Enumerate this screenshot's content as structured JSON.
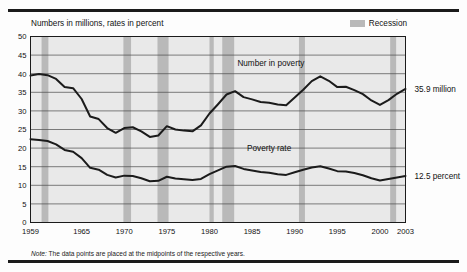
{
  "figure": {
    "subtitle": "Numbers in millions, rates in percent",
    "note_prefix": "Note:",
    "note_text": " The data points are placed at the midpoints of the respective years.",
    "legend_label": "Recession",
    "recession_color": "#b9b9b9",
    "line_color": "#1b1b1b",
    "grid_color": "#4a4a4a",
    "plot_bg": "#e9e9e9",
    "frame_color": "#1b1b1b"
  },
  "chart_data": {
    "type": "line",
    "title": "",
    "subtitle": "Numbers in millions, rates in percent",
    "xlabel": "",
    "ylabel": "",
    "ylim": [
      0,
      50
    ],
    "xlim": [
      1959,
      2003
    ],
    "ytick_step": 5,
    "yticks": [
      0,
      5,
      10,
      15,
      20,
      25,
      30,
      35,
      40,
      45,
      50
    ],
    "xticks": [
      1959,
      1965,
      1970,
      1975,
      1980,
      1985,
      1990,
      1995,
      2000,
      2003
    ],
    "grid": true,
    "legend_position": "top-right",
    "x": [
      1959,
      1960,
      1961,
      1962,
      1963,
      1964,
      1965,
      1966,
      1967,
      1968,
      1969,
      1970,
      1971,
      1972,
      1973,
      1974,
      1975,
      1976,
      1977,
      1978,
      1979,
      1980,
      1981,
      1982,
      1983,
      1984,
      1985,
      1986,
      1987,
      1988,
      1989,
      1990,
      1991,
      1992,
      1993,
      1994,
      1995,
      1996,
      1997,
      1998,
      1999,
      2000,
      2001,
      2002,
      2003
    ],
    "series": [
      {
        "name": "Number in poverty",
        "label": "Number in poverty",
        "units": "millions",
        "end_label": "35.9 million",
        "values": [
          39.5,
          39.9,
          39.6,
          38.6,
          36.4,
          36.1,
          33.2,
          28.5,
          27.8,
          25.4,
          24.1,
          25.4,
          25.6,
          24.5,
          23.0,
          23.4,
          25.9,
          25.0,
          24.7,
          24.5,
          26.1,
          29.3,
          31.8,
          34.4,
          35.3,
          33.7,
          33.1,
          32.4,
          32.2,
          31.7,
          31.5,
          33.6,
          35.7,
          38.0,
          39.3,
          38.1,
          36.4,
          36.5,
          35.6,
          34.5,
          32.8,
          31.6,
          32.9,
          34.6,
          35.9
        ]
      },
      {
        "name": "Poverty rate",
        "label": "Poverty rate",
        "units": "percent",
        "end_label": "12.5 percent",
        "values": [
          22.4,
          22.2,
          21.9,
          21.0,
          19.5,
          19.0,
          17.3,
          14.7,
          14.2,
          12.8,
          12.1,
          12.6,
          12.5,
          11.9,
          11.1,
          11.2,
          12.3,
          11.8,
          11.6,
          11.4,
          11.7,
          13.0,
          14.0,
          15.0,
          15.2,
          14.4,
          14.0,
          13.6,
          13.4,
          13.0,
          12.8,
          13.5,
          14.2,
          14.8,
          15.1,
          14.5,
          13.8,
          13.7,
          13.3,
          12.7,
          11.9,
          11.3,
          11.7,
          12.1,
          12.5
        ]
      }
    ],
    "recessions": [
      {
        "start": 1960.3,
        "end": 1961.1
      },
      {
        "start": 1969.9,
        "end": 1970.8
      },
      {
        "start": 1973.9,
        "end": 1975.2
      },
      {
        "start": 1980.0,
        "end": 1980.5
      },
      {
        "start": 1981.5,
        "end": 1982.9
      },
      {
        "start": 1990.5,
        "end": 1991.2
      },
      {
        "start": 2001.2,
        "end": 2001.9
      }
    ],
    "annotations": [
      {
        "text": "Number in poverty",
        "x": 1987.2,
        "y": 42.0
      },
      {
        "text": "Poverty rate",
        "x": 1987.0,
        "y": 19.2
      }
    ]
  }
}
